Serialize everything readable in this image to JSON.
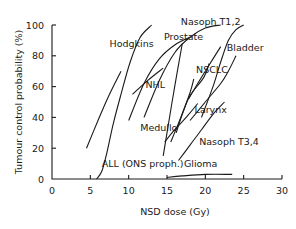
{
  "chart_data": {
    "type": "line",
    "title": "",
    "xlabel": "NSD dose (Gy)",
    "ylabel": "Tumour control probability (%)",
    "xlim": [
      0,
      30
    ],
    "ylim": [
      0,
      100
    ],
    "x_ticks": [
      0,
      5,
      10,
      15,
      20,
      25,
      30
    ],
    "y_ticks": [
      0,
      20,
      40,
      60,
      80,
      100
    ],
    "grid": false,
    "legend": "none (curves labeled directly)",
    "series": [
      {
        "name": "Hodgkins",
        "points": [
          [
            10,
            38
          ],
          [
            12,
            62
          ],
          [
            14,
            78
          ],
          [
            16,
            87
          ],
          [
            18,
            92
          ]
        ]
      },
      {
        "name": "Prostate",
        "points": [
          [
            12,
            40
          ],
          [
            14,
            64
          ],
          [
            16,
            82
          ],
          [
            18,
            92
          ],
          [
            20,
            98
          ],
          [
            22,
            100
          ]
        ]
      },
      {
        "name": "Nasoph T1,2",
        "points": [
          [
            19.5,
            40
          ],
          [
            21,
            60
          ],
          [
            22,
            76
          ],
          [
            23,
            90
          ],
          [
            24,
            97
          ],
          [
            25,
            100
          ]
        ]
      },
      {
        "name": "NHL",
        "points": [
          [
            10.5,
            55
          ],
          [
            12.5,
            64
          ],
          [
            14.5,
            72
          ]
        ]
      },
      {
        "name": "Bladder",
        "points": [
          [
            18,
            38
          ],
          [
            20,
            50
          ],
          [
            22,
            62
          ],
          [
            23,
            70
          ],
          [
            24,
            80
          ]
        ]
      },
      {
        "name": "NSCLC",
        "points": [
          [
            17.8,
            52
          ],
          [
            19,
            62
          ],
          [
            20,
            70
          ],
          [
            21,
            78
          ],
          [
            22,
            86
          ]
        ]
      },
      {
        "name": "Medullo (line 1)",
        "points": [
          [
            17,
            88
          ],
          [
            16,
            60
          ],
          [
            15,
            30
          ],
          [
            14.5,
            15
          ]
        ]
      },
      {
        "name": "Medullo (line 2)",
        "points": [
          [
            14.7,
            24
          ],
          [
            16,
            32
          ],
          [
            17.5,
            40
          ],
          [
            19,
            49
          ]
        ]
      },
      {
        "name": "Larynx",
        "points": [
          [
            15.5,
            24
          ],
          [
            16.8,
            40
          ],
          [
            18,
            56
          ],
          [
            18.5,
            65
          ]
        ]
      },
      {
        "name": "Larynx (line 2)",
        "points": [
          [
            16.2,
            30
          ],
          [
            17,
            42
          ],
          [
            18,
            54
          ],
          [
            19.8,
            66
          ],
          [
            20.5,
            75
          ]
        ]
      },
      {
        "name": "Nasoph T3,4",
        "points": [
          [
            16.5,
            12
          ],
          [
            18,
            22
          ],
          [
            19.5,
            32
          ],
          [
            21,
            42
          ],
          [
            22.5,
            50
          ]
        ]
      },
      {
        "name": "Glioma",
        "points": [
          [
            15,
            1
          ],
          [
            17,
            2
          ],
          [
            20,
            3
          ],
          [
            23.5,
            3
          ]
        ]
      },
      {
        "name": "ALL (CNS proph.)",
        "points": [
          [
            4.5,
            20
          ],
          [
            6,
            38
          ],
          [
            7.5,
            55
          ],
          [
            9,
            70
          ]
        ]
      },
      {
        "name": "ALL (CNS proph.) steep",
        "points": [
          [
            5.8,
            0
          ],
          [
            6.5,
            5
          ],
          [
            7.2,
            18
          ],
          [
            8,
            36
          ],
          [
            9,
            55
          ],
          [
            10.2,
            76
          ],
          [
            11.5,
            92
          ],
          [
            13,
            100
          ]
        ]
      }
    ],
    "labels": [
      {
        "text": "Hodgkins",
        "x": 7.5,
        "y": 86
      },
      {
        "text": "Prostate",
        "x": 14.6,
        "y": 90
      },
      {
        "text": "Nasoph T1,2",
        "x": 16.8,
        "y": 100
      },
      {
        "text": "NHL",
        "x": 12.2,
        "y": 59
      },
      {
        "text": "Bladder",
        "x": 22.8,
        "y": 83
      },
      {
        "text": "NSCLC",
        "x": 18.8,
        "y": 69
      },
      {
        "text": "Medullo",
        "x": 11.5,
        "y": 31
      },
      {
        "text": "Larynx",
        "x": 18.6,
        "y": 43
      },
      {
        "text": "Nasoph T3,4",
        "x": 19.2,
        "y": 22
      },
      {
        "text": "Glioma",
        "x": 17.2,
        "y": 8
      },
      {
        "text": "ALL (ONS proph.)",
        "x": 6.5,
        "y": 8
      }
    ]
  },
  "axes": {
    "xlabel": "NSD dose (Gy)",
    "ylabel": "Tumour control probability (%)"
  }
}
